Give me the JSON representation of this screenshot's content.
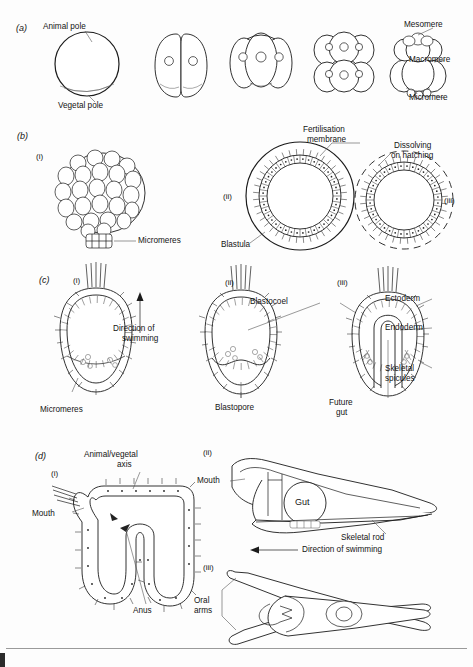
{
  "figure": {
    "background": "#fdfdfd",
    "ink": "#1a1a1a"
  },
  "panels": [
    {
      "id": "a",
      "label": "(a)",
      "caption": "Cleavage stages",
      "labels": [
        {
          "name": "animal-pole",
          "text": "Animal pole"
        },
        {
          "name": "vegetal-pole",
          "text": "Vegetal pole"
        },
        {
          "name": "mesomere",
          "text": "Mesomere"
        },
        {
          "name": "macromere",
          "text": "Macromere"
        },
        {
          "name": "micromere",
          "text": "Micromere"
        }
      ],
      "stages": [
        "1-cell zygote",
        "2-cell",
        "4-cell",
        "8-cell",
        "16-cell"
      ]
    },
    {
      "id": "b",
      "label": "(b)",
      "caption": "Morula and blastula",
      "subpanels": [
        "(i)",
        "(ii)",
        "(iii)"
      ],
      "labels": [
        {
          "name": "micromeres",
          "text": "Micromeres"
        },
        {
          "name": "fertilisation-membrane",
          "text": "Fertilisation\nmembrane"
        },
        {
          "name": "dissolving-on-hatching",
          "text": "Dissolving\non hatching"
        },
        {
          "name": "blastula",
          "text": "Blastula"
        }
      ]
    },
    {
      "id": "c",
      "label": "(c)",
      "caption": "Gastrulation",
      "subpanels": [
        "(i)",
        "(ii)",
        "(iii)"
      ],
      "labels": [
        {
          "name": "micromeres",
          "text": "Micromeres"
        },
        {
          "name": "direction-of-swimming",
          "text": "Direction of\nswimming"
        },
        {
          "name": "blastocoel",
          "text": "Blastocoel"
        },
        {
          "name": "blastopore",
          "text": "Blastopore"
        },
        {
          "name": "ectoderm",
          "text": "Ectoderm"
        },
        {
          "name": "endoderm",
          "text": "Endoderm"
        },
        {
          "name": "skeletal-spicules",
          "text": "Skeletal\nspicules"
        },
        {
          "name": "future-gut",
          "text": "Future\ngut"
        }
      ]
    },
    {
      "id": "d",
      "label": "(d)",
      "caption": "Pluteus larva",
      "subpanels": [
        "(i)",
        "(ii)",
        "(iii)"
      ],
      "labels": [
        {
          "name": "animal-vegetal-axis",
          "text": "Animal/vegetal\naxis"
        },
        {
          "name": "mouth",
          "text": "Mouth"
        },
        {
          "name": "anus",
          "text": "Anus"
        },
        {
          "name": "mouth-2",
          "text": "Mouth"
        },
        {
          "name": "gut",
          "text": "Gut"
        },
        {
          "name": "skeletal-rod",
          "text": "Skeletal rod"
        },
        {
          "name": "direction-of-swimming",
          "text": "Direction of swimming"
        },
        {
          "name": "oral-arms",
          "text": "Oral\narms"
        }
      ]
    }
  ],
  "text": {
    "panel_a": "(a)",
    "panel_b": "(b)",
    "panel_c": "(c)",
    "panel_d": "(d)",
    "rom_i": "(i)",
    "rom_ii": "(ii)",
    "rom_iii": "(iii)",
    "animal_pole": "Animal pole",
    "vegetal_pole": "Vegetal pole",
    "mesomere": "Mesomere",
    "macromere": "Macromere",
    "micromere": "Micromere",
    "micromeres": "Micromeres",
    "fertilisation_membrane_l1": "Fertilisation",
    "fertilisation_membrane_l2": "membrane",
    "dissolving_l1": "Dissolving",
    "dissolving_l2": "on hatching",
    "blastula": "Blastula",
    "direction_l1": "Direction of",
    "direction_l2": "swimming",
    "blastocoel": "Blastocoel",
    "blastopore": "Blastopore",
    "ectoderm": "Ectoderm",
    "endoderm": "Endoderm",
    "skeletal_l1": "Skeletal",
    "skeletal_l2": "spicules",
    "future_l1": "Future",
    "future_l2": "gut",
    "axis_l1": "Animal/vegetal",
    "axis_l2": "axis",
    "mouth": "Mouth",
    "anus": "Anus",
    "gut": "Gut",
    "skeletal_rod": "Skeletal rod",
    "direction_swimming": "Direction of swimming",
    "oral_l1": "Oral",
    "oral_l2": "arms"
  }
}
